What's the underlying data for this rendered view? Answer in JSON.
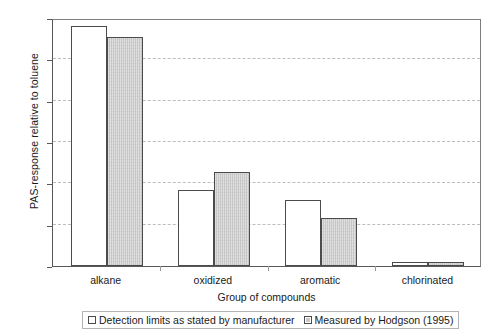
{
  "chart_data": {
    "type": "bar",
    "title": "",
    "xlabel": "Group of compounds",
    "ylabel": "PAS-response relative to toluene",
    "categories": [
      "alkane",
      "oxidized",
      "aromatic",
      "chlorinated"
    ],
    "series": [
      {
        "name": "Detection limits as stated by manufacturer",
        "values": [
          5.8,
          1.83,
          1.6,
          0.1
        ],
        "color": "#ffffff",
        "swatch": "open-square"
      },
      {
        "name": "Measured by Hodgson (1995)",
        "values": [
          5.55,
          2.27,
          1.17,
          0.1
        ],
        "color": "#c9c9c9",
        "swatch": "filled-square"
      }
    ],
    "ylim": [
      0,
      6
    ],
    "yticks": [
      0,
      1,
      2,
      3,
      4,
      5,
      6
    ],
    "ytick_labels": [
      "0",
      "1",
      "2",
      "3",
      "4",
      "5",
      "6"
    ],
    "grid": "horizontal-dashed",
    "legend_position": "bottom"
  },
  "axes": {
    "y_title": "PAS-response relative to toluene",
    "x_title": "Group of compounds"
  },
  "legend": {
    "entries": [
      {
        "label": "Detection limits as stated by manufacturer"
      },
      {
        "label": "Measured by Hodgson (1995)"
      }
    ]
  }
}
